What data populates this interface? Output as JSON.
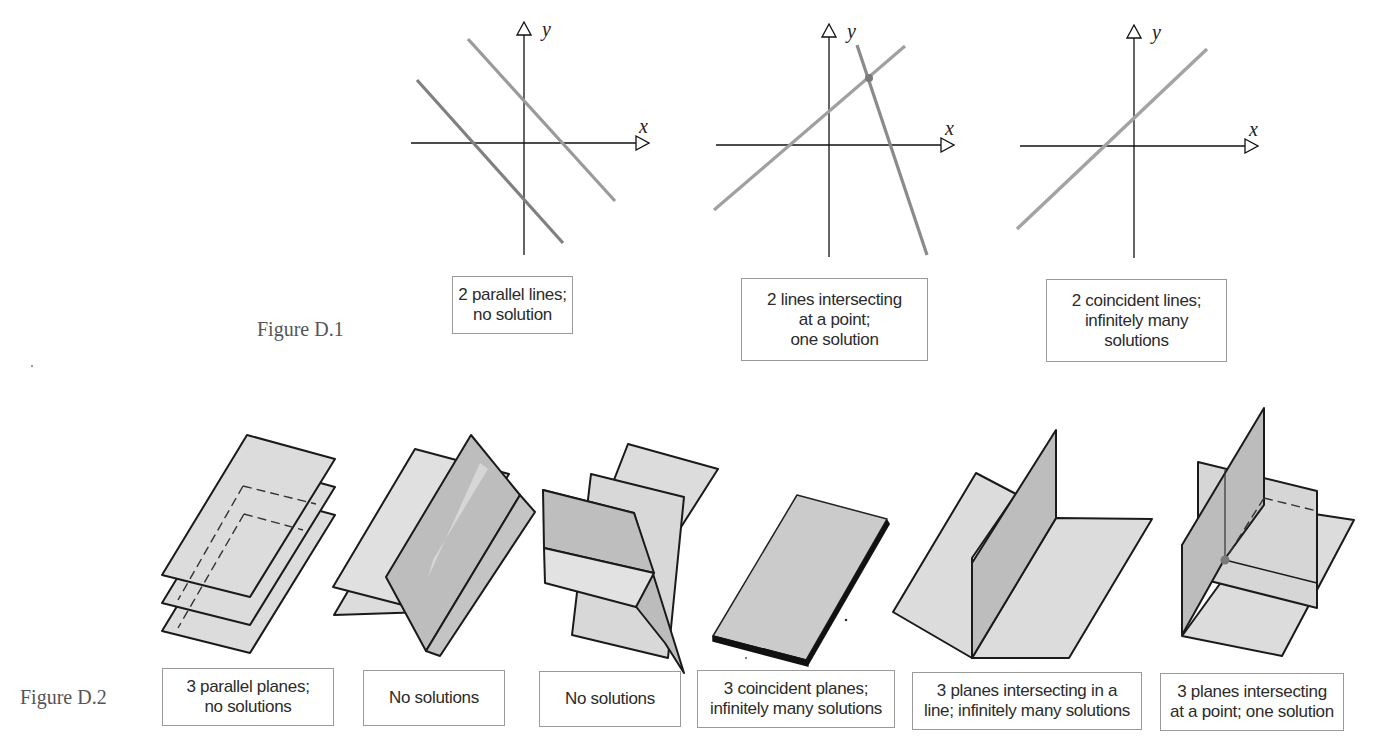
{
  "page": {
    "top_fragment": "·   ·"
  },
  "figure_d1": {
    "caption": "Figure D.1",
    "panels": [
      {
        "id": "parallel-lines",
        "x_axis_label": "x",
        "y_axis_label": "y",
        "label_lines": "2 parallel lines;\nno solution"
      },
      {
        "id": "intersecting-lines",
        "x_axis_label": "x",
        "y_axis_label": "y",
        "label_lines": "2 lines intersecting\nat a point;\none solution"
      },
      {
        "id": "coincident-lines",
        "x_axis_label": "x",
        "y_axis_label": "y",
        "label_lines": "2 coincident lines;\ninfinitely many\nsolutions"
      }
    ]
  },
  "figure_d2": {
    "caption": "Figure D.2",
    "panels": [
      {
        "id": "three-parallel-planes",
        "label_lines": "3 parallel planes;\nno solutions"
      },
      {
        "id": "no-solutions-a",
        "label_lines": "No solutions"
      },
      {
        "id": "no-solutions-b",
        "label_lines": "No solutions"
      },
      {
        "id": "three-coincident-planes",
        "label_lines": "3 coincident planes;\ninfinitely many solutions"
      },
      {
        "id": "planes-intersecting-line",
        "label_lines": "3 planes intersecting in a\nline; infinitely many solutions"
      },
      {
        "id": "planes-intersecting-point",
        "label_lines": "3 planes intersecting\nat a point; one solution"
      }
    ]
  },
  "colors": {
    "plane_light": "#dcdcdc",
    "plane_dark": "#bcbcbc",
    "edge": "#1a1a1a",
    "line_gray": "#8c8c8c",
    "box_border": "#9a9a9a",
    "intersection_point": "#7a7a7a"
  }
}
